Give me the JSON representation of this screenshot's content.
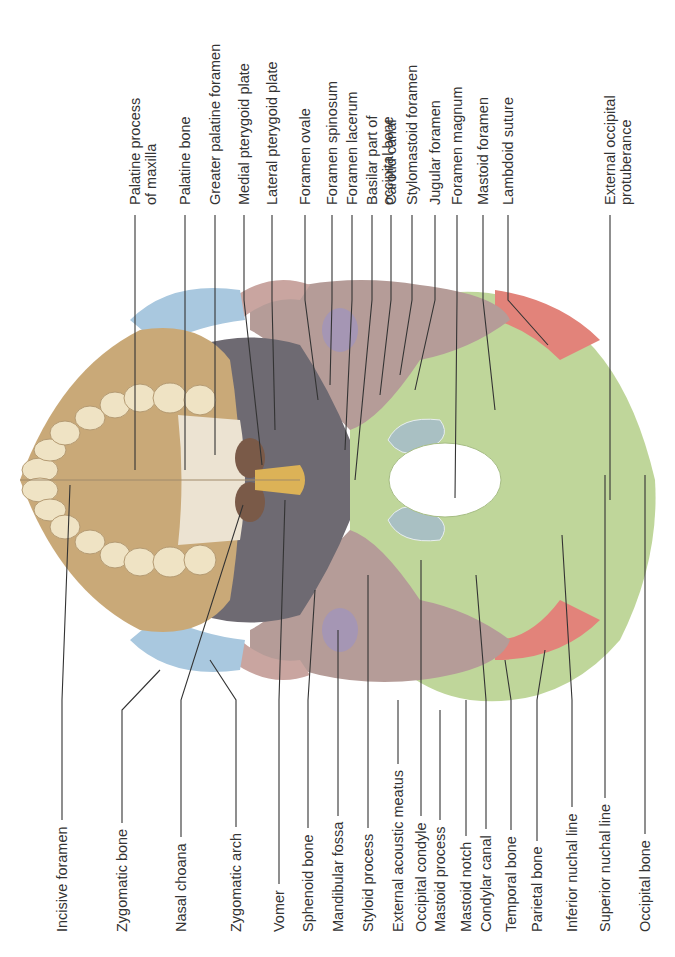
{
  "figure": {
    "colors": {
      "maxilla": "#c9a978",
      "palatine": "#ece3d2",
      "zygomatic": "#a9c8df",
      "sphenoid": "#6e6a72",
      "temporal": "#b59c98",
      "occipital": "#bfd69a",
      "parietal": "#e2837a",
      "vomer": "#dcb257",
      "condyle": "#a9c0c3",
      "mandibular_fossa": "#a596b4",
      "teeth": "#efe3c4",
      "leader_line": "#333333"
    },
    "top_labels": [
      {
        "id": "palatine-process-of-maxilla",
        "lines": [
          "Palatine process",
          "of maxilla"
        ]
      },
      {
        "id": "palatine-bone",
        "lines": [
          "Palatine bone"
        ]
      },
      {
        "id": "greater-palatine-foramen",
        "lines": [
          "Greater palatine foramen"
        ]
      },
      {
        "id": "medial-pterygoid-plate",
        "lines": [
          "Medial pterygoid plate"
        ]
      },
      {
        "id": "lateral-pterygoid-plate",
        "lines": [
          "Lateral pterygoid plate"
        ]
      },
      {
        "id": "foramen-ovale",
        "lines": [
          "Foramen ovale"
        ]
      },
      {
        "id": "foramen-spinosum",
        "lines": [
          "Foramen spinosum"
        ]
      },
      {
        "id": "foramen-lacerum",
        "lines": [
          "Foramen lacerum"
        ]
      },
      {
        "id": "basilar-part-of-occipital-bone",
        "lines": [
          "Basilar part of",
          "occipital bone"
        ]
      },
      {
        "id": "carotid-canal",
        "lines": [
          "Carotid canal"
        ]
      },
      {
        "id": "stylomastoid-foramen",
        "lines": [
          "Stylomastoid foramen"
        ]
      },
      {
        "id": "jugular-foramen",
        "lines": [
          "Jugular foramen"
        ]
      },
      {
        "id": "foramen-magnum",
        "lines": [
          "Foramen magnum"
        ]
      },
      {
        "id": "mastoid-foramen",
        "lines": [
          "Mastoid foramen"
        ]
      },
      {
        "id": "lambdoid-suture",
        "lines": [
          "Lambdoid suture"
        ]
      },
      {
        "id": "external-occipital-protuberance",
        "lines": [
          "External occipital",
          "protuberance"
        ]
      }
    ],
    "bottom_labels": [
      {
        "id": "incisive-foramen",
        "lines": [
          "Incisive foramen"
        ]
      },
      {
        "id": "zygomatic-bone",
        "lines": [
          "Zygomatic bone"
        ]
      },
      {
        "id": "nasal-choana",
        "lines": [
          "Nasal choana"
        ]
      },
      {
        "id": "zygomatic-arch",
        "lines": [
          "Zygomatic arch"
        ]
      },
      {
        "id": "vomer",
        "lines": [
          "Vomer"
        ]
      },
      {
        "id": "sphenoid-bone",
        "lines": [
          "Sphenoid bone"
        ]
      },
      {
        "id": "mandibular-fossa",
        "lines": [
          "Mandibular fossa"
        ]
      },
      {
        "id": "styloid-process",
        "lines": [
          "Styloid process"
        ]
      },
      {
        "id": "external-acoustic-meatus",
        "lines": [
          "External acoustic meatus"
        ]
      },
      {
        "id": "occipital-condyle",
        "lines": [
          "Occipital condyle"
        ]
      },
      {
        "id": "mastoid-process",
        "lines": [
          "Mastoid process"
        ]
      },
      {
        "id": "mastoid-notch",
        "lines": [
          "Mastoid notch"
        ]
      },
      {
        "id": "condylar-canal",
        "lines": [
          "Condylar canal"
        ]
      },
      {
        "id": "temporal-bone",
        "lines": [
          "Temporal bone"
        ]
      },
      {
        "id": "parietal-bone",
        "lines": [
          "Parietal bone"
        ]
      },
      {
        "id": "inferior-nuchal-line",
        "lines": [
          "Inferior nuchal line"
        ]
      },
      {
        "id": "superior-nuchal-line",
        "lines": [
          "Superior nuchal line"
        ]
      },
      {
        "id": "occipital-bone",
        "lines": [
          "Occipital bone"
        ]
      }
    ]
  }
}
